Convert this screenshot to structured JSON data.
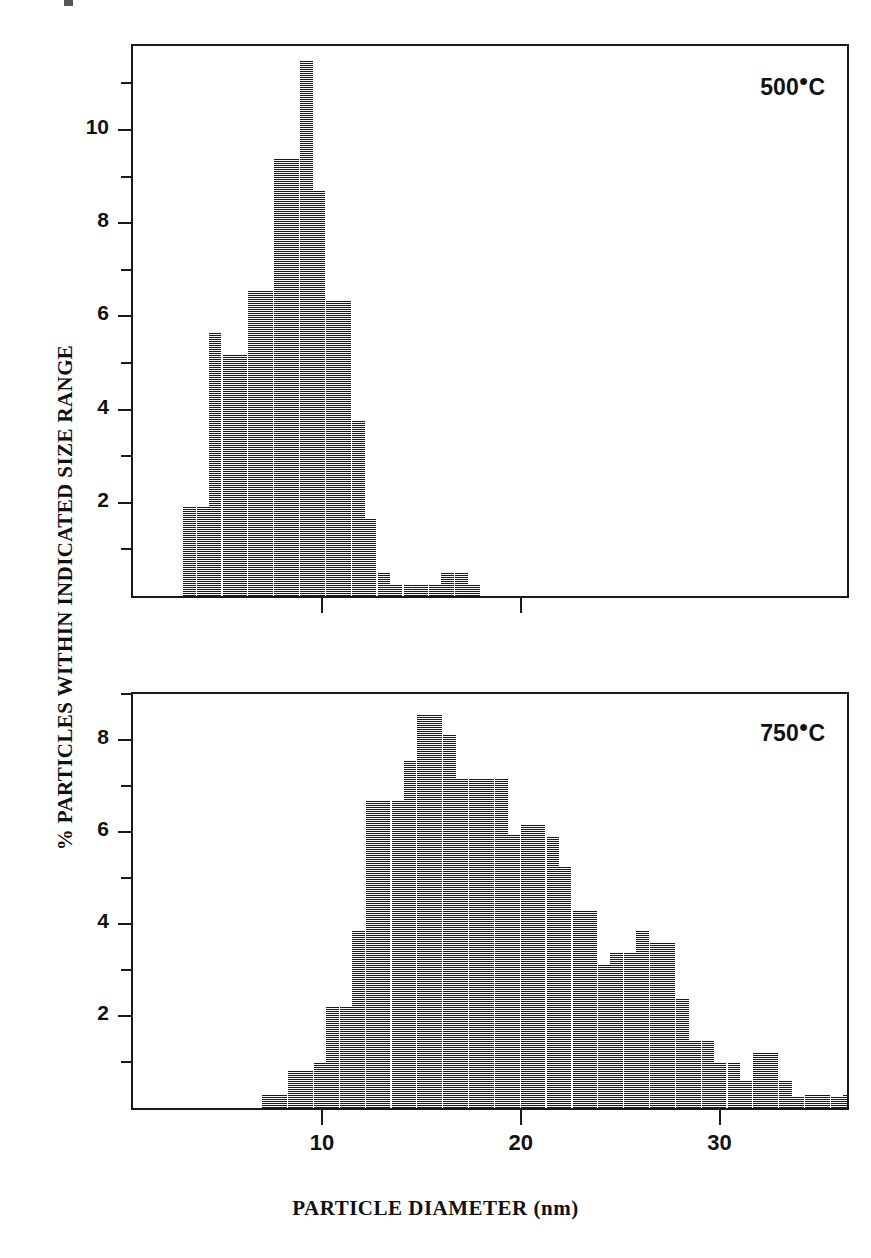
{
  "figure": {
    "y_axis_title": "% PARTICLES WITHIN INDICATED SIZE RANGE",
    "x_axis_title": "PARTICLE DIAMETER (nm)"
  },
  "panels": {
    "top": {
      "note_value": "500",
      "note_unit": "C",
      "y_labels": [
        "10",
        "8",
        "6",
        "4",
        "2"
      ],
      "x_labels": []
    },
    "bottom": {
      "note_value": "750",
      "note_unit": "C",
      "y_labels": [
        "8",
        "6",
        "4",
        "2"
      ],
      "x_labels": [
        "10",
        "20",
        "30"
      ]
    }
  },
  "chart_data": [
    {
      "type": "bar",
      "title": "500 °C",
      "xlabel": "PARTICLE DIAMETER (nm)",
      "ylabel": "% PARTICLES WITHIN INDICATED SIZE RANGE",
      "xlim": [
        0,
        36.9
      ],
      "ylim": [
        0,
        11.8
      ],
      "grid": false,
      "legend": "none",
      "bin_width": 0.665,
      "annotation": "500 °C",
      "x": [
        3.0,
        3.7,
        4.3,
        5.0,
        5.6,
        6.3,
        6.9,
        7.6,
        8.2,
        8.9,
        9.5,
        10.2,
        10.8,
        11.5,
        12.1,
        12.8,
        13.4,
        14.1,
        14.7,
        15.4,
        16.0,
        16.7,
        17.3
      ],
      "values": [
        1.9,
        1.9,
        5.65,
        5.2,
        5.2,
        6.55,
        6.55,
        9.4,
        9.4,
        11.5,
        8.7,
        6.35,
        6.35,
        3.75,
        1.65,
        0.5,
        0.25,
        0.25,
        0.25,
        0.25,
        0.5,
        0.5,
        0.25
      ],
      "categories": [
        "3.0",
        "3.7",
        "4.3",
        "5.0",
        "5.6",
        "6.3",
        "6.9",
        "7.6",
        "8.2",
        "8.9",
        "9.5",
        "10.2",
        "10.8",
        "11.5",
        "12.1",
        "12.8",
        "13.4",
        "14.1",
        "14.7",
        "15.4",
        "16.0",
        "16.7",
        "17.3"
      ]
    },
    {
      "type": "bar",
      "title": "750 °C",
      "xlabel": "PARTICLE DIAMETER (nm)",
      "ylabel": "% PARTICLES WITHIN INDICATED SIZE RANGE",
      "xlim": [
        0,
        36.9
      ],
      "ylim": [
        0,
        9.0
      ],
      "grid": false,
      "legend": "none",
      "bin_width": 0.665,
      "annotation": "750 °C",
      "x": [
        7.0,
        7.6,
        8.3,
        8.9,
        9.6,
        10.2,
        10.9,
        11.5,
        12.2,
        12.8,
        13.5,
        14.1,
        14.8,
        15.4,
        16.1,
        16.7,
        17.4,
        18.0,
        18.7,
        19.3,
        20.0,
        20.6,
        21.3,
        21.9,
        22.6,
        23.2,
        23.9,
        24.5,
        25.2,
        25.8,
        26.5,
        27.1,
        27.8,
        28.4,
        29.1,
        29.7,
        30.4,
        31.0,
        31.7,
        32.3,
        33.0,
        33.6,
        34.3,
        34.9,
        35.6,
        36.2
      ],
      "values": [
        0.3,
        0.3,
        0.8,
        0.8,
        1.0,
        2.2,
        2.2,
        3.85,
        6.7,
        6.7,
        6.7,
        7.55,
        8.55,
        8.55,
        8.1,
        7.15,
        7.15,
        7.15,
        7.15,
        5.95,
        6.15,
        6.15,
        5.9,
        5.25,
        4.3,
        4.3,
        3.1,
        3.4,
        3.4,
        3.85,
        3.6,
        3.6,
        2.4,
        1.45,
        1.45,
        1.0,
        1.0,
        0.6,
        1.2,
        1.2,
        0.6,
        0.25,
        0.3,
        0.3,
        0.25,
        0.3
      ],
      "categories": [
        "7.0",
        "7.6",
        "8.3",
        "8.9",
        "9.6",
        "10.2",
        "10.9",
        "11.5",
        "12.2",
        "12.8",
        "13.5",
        "14.1",
        "14.8",
        "15.4",
        "16.1",
        "16.7",
        "17.4",
        "18.0",
        "18.7",
        "19.3",
        "20.0",
        "20.6",
        "21.3",
        "21.9",
        "22.6",
        "23.2",
        "23.9",
        "24.5",
        "25.2",
        "25.8",
        "26.5",
        "27.1",
        "27.8",
        "28.4",
        "29.1",
        "29.7",
        "30.4",
        "31.0",
        "31.7",
        "32.3",
        "33.0",
        "33.6",
        "34.3",
        "34.9",
        "35.6",
        "36.2"
      ]
    }
  ]
}
